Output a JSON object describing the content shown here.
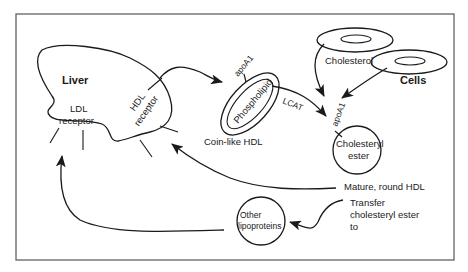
{
  "diagram": {
    "nodes": {
      "liver": {
        "label": "Liver"
      },
      "ldl_receptor": {
        "line1": "LDL",
        "line2": "receptor"
      },
      "hdl_receptor": {
        "line1": "HDL",
        "line2": "receptor"
      },
      "phospholipid": {
        "label": "Phospholipid",
        "apo": "apoA1",
        "caption": "Coin-like HDL"
      },
      "cells": {
        "label": "Cells",
        "cholesterol": "Cholesterol"
      },
      "cholesteryl_ester": {
        "line1": "Cholesteryl",
        "line2": "ester",
        "apo": "apoA1"
      },
      "other_lipoproteins": {
        "line1": "Other",
        "line2": "lipoproteins"
      }
    },
    "edges": {
      "lcat": "LCAT",
      "mature_hdl": "Mature, round HDL",
      "transfer_line1": "Transfer",
      "transfer_line2": "cholesteryl ester",
      "transfer_line3": "to"
    },
    "colors": {
      "ink": "#1a1a1a",
      "frame": "#555555",
      "background": "#ffffff"
    }
  }
}
